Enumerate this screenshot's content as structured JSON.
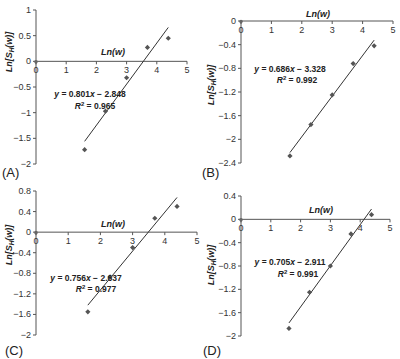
{
  "figure": {
    "panels": [
      "A",
      "B",
      "C",
      "D"
    ]
  },
  "chart_data": [
    {
      "type": "scatter",
      "panel_label": "(A)",
      "title": "",
      "xlabel": "Ln(w)",
      "ylabel": "Ln[S_H(w)]",
      "xlim": [
        0,
        5
      ],
      "ylim": [
        -2,
        1
      ],
      "xticks": [
        0,
        1,
        2,
        3,
        4,
        5
      ],
      "yticks": [
        1,
        0.5,
        0,
        -0.5,
        -1,
        -1.5,
        -2
      ],
      "ytick_labels": [
        "1",
        "0.5",
        "0",
        "−0.5",
        "−1",
        "−1.5",
        "−2"
      ],
      "grid": false,
      "x": [
        1.61,
        2.3,
        3.0,
        3.69,
        4.38
      ],
      "y": [
        -1.72,
        -0.97,
        -0.32,
        0.27,
        0.45
      ],
      "fit": {
        "slope": 0.801,
        "intercept": -2.848,
        "x_range": [
          1.61,
          4.38
        ]
      },
      "equation": "y = 0.801x − 2.848",
      "r2_label": "R",
      "r2_value": " = 0.965"
    },
    {
      "type": "scatter",
      "panel_label": "(B)",
      "title": "",
      "xlabel": "Ln(w)",
      "ylabel": "Ln[S_H(w)]",
      "xlim": [
        0,
        5
      ],
      "ylim": [
        -2.4,
        0
      ],
      "xticks": [
        0,
        1,
        2,
        3,
        4,
        5
      ],
      "yticks": [
        0,
        -0.4,
        -0.8,
        -1.2,
        -1.6,
        -2,
        -2.4
      ],
      "ytick_labels": [
        "0",
        "−0.4",
        "−0.8",
        "−1.2",
        "−1.6",
        "−2",
        "−2.4"
      ],
      "grid": false,
      "x": [
        1.61,
        2.3,
        3.0,
        3.69,
        4.38
      ],
      "y": [
        -2.28,
        -1.75,
        -1.25,
        -0.72,
        -0.42
      ],
      "fit": {
        "slope": 0.686,
        "intercept": -3.328,
        "x_range": [
          1.61,
          4.38
        ]
      },
      "equation": "y = 0.686x − 3.328",
      "r2_label": "R",
      "r2_value": " = 0.992"
    },
    {
      "type": "scatter",
      "panel_label": "(C)",
      "title": "",
      "xlabel": "Ln(w)",
      "ylabel": "Ln[S_H(w)]",
      "xlim": [
        0,
        5
      ],
      "ylim": [
        -2,
        0.8
      ],
      "xticks": [
        0,
        1,
        2,
        3,
        4,
        5
      ],
      "yticks": [
        0.8,
        0.4,
        0,
        -0.4,
        -0.8,
        -1.2,
        -1.6,
        -2
      ],
      "ytick_labels": [
        "0.8",
        "0.4",
        "0",
        "−0.4",
        "−0.8",
        "−1.2",
        "−1.6",
        "−2"
      ],
      "grid": false,
      "x": [
        1.61,
        2.3,
        3.0,
        3.69,
        4.38
      ],
      "y": [
        -1.55,
        -0.87,
        -0.3,
        0.27,
        0.5
      ],
      "fit": {
        "slope": 0.756,
        "intercept": -2.637,
        "x_range": [
          1.61,
          4.38
        ]
      },
      "equation": "y = 0.756x − 2.637",
      "r2_label": "R",
      "r2_value": " = 0.977"
    },
    {
      "type": "scatter",
      "panel_label": "(D)",
      "title": "",
      "xlabel": "Ln(w)",
      "ylabel": "Ln[S_H(w)]",
      "xlim": [
        0,
        5
      ],
      "ylim": [
        -2,
        0.4
      ],
      "xticks": [
        0,
        1,
        2,
        3,
        4,
        5
      ],
      "yticks": [
        0.4,
        0,
        -0.4,
        -0.8,
        -1.2,
        -1.6,
        -2
      ],
      "ytick_labels": [
        "0.4",
        "0",
        "−0.4",
        "−0.8",
        "−1.2",
        "−1.6",
        "−2"
      ],
      "grid": false,
      "x": [
        1.61,
        2.3,
        3.0,
        3.69,
        4.38
      ],
      "y": [
        -1.87,
        -1.25,
        -0.8,
        -0.25,
        0.08
      ],
      "fit": {
        "slope": 0.705,
        "intercept": -2.911,
        "x_range": [
          1.61,
          4.38
        ]
      },
      "equation": "y = 0.705x − 2.911",
      "r2_label": "R",
      "r2_value": " = 0.991"
    }
  ],
  "layout": {
    "panels": [
      {
        "x0": 36,
        "x5": 187,
        "ytop": 10,
        "ybot": 164,
        "xaxis_y": 60,
        "eq_x": 90,
        "eq_y": 97,
        "r2_x": 95,
        "r2_y": 109,
        "label_x": 2,
        "label_y": 177,
        "xlabel_x": 113,
        "xlabel_y": 55,
        "ylabel_x": 12,
        "ylabel_y": 52
      },
      {
        "x0": 241,
        "x5": 393,
        "ytop": 21,
        "ybot": 163,
        "xaxis_y": 21,
        "eq_x": 290,
        "eq_y": 72,
        "r2_x": 297,
        "r2_y": 83,
        "label_x": 202,
        "label_y": 177,
        "xlabel_x": 318,
        "xlabel_y": 17,
        "ylabel_x": 214,
        "ylabel_y": 85
      },
      {
        "x0": 36,
        "x5": 197,
        "ytop": 191,
        "ybot": 335,
        "xaxis_y": 233,
        "eq_x": 86,
        "eq_y": 281,
        "r2_x": 96,
        "r2_y": 292,
        "label_x": 5,
        "label_y": 355,
        "xlabel_x": 113,
        "xlabel_y": 227,
        "ylabel_x": 12,
        "ylabel_y": 245
      },
      {
        "x0": 241,
        "x5": 390,
        "ytop": 196,
        "ybot": 336,
        "xaxis_y": 219,
        "eq_x": 290,
        "eq_y": 265,
        "r2_x": 298,
        "r2_y": 277,
        "label_x": 203,
        "label_y": 355,
        "xlabel_x": 321,
        "xlabel_y": 213,
        "ylabel_x": 214,
        "ylabel_y": 265
      }
    ]
  }
}
